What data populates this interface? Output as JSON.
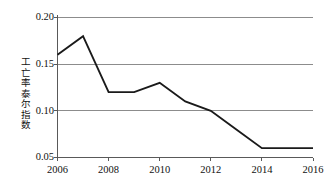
{
  "chart_data": {
    "type": "line",
    "title": "",
    "subtitle": "",
    "xlabel": "（年份）",
    "ylabel": "工亡率泰尔指数",
    "x": [
      2006,
      2007,
      2008,
      2009,
      2010,
      2011,
      2012,
      2013,
      2014,
      2015,
      2016
    ],
    "values": [
      0.16,
      0.18,
      0.12,
      0.12,
      0.13,
      0.11,
      0.1,
      0.08,
      0.06,
      0.06,
      0.06
    ],
    "series": [
      {
        "name": "工亡率泰尔指数",
        "values": [
          0.16,
          0.18,
          0.12,
          0.12,
          0.13,
          0.11,
          0.1,
          0.08,
          0.06,
          0.06,
          0.06
        ]
      }
    ],
    "xlim": [
      2006,
      2016
    ],
    "ylim": [
      0.05,
      0.2
    ],
    "xticks": [
      2006,
      2008,
      2010,
      2012,
      2014,
      2016
    ],
    "xtick_labels": [
      "2006",
      "2008",
      "2010",
      "2012",
      "2014",
      "2016"
    ],
    "yticks": [
      0.05,
      0.1,
      0.15,
      0.2
    ],
    "ytick_labels": [
      "0.05",
      "0.10",
      "0.15",
      "0.20"
    ],
    "grid": "horizontal",
    "legend": "none",
    "line_color": "#1a1a1a",
    "grid_color": "#8c8c8c",
    "axis_color": "#595959",
    "background_color": "#ffffff",
    "annotations": []
  },
  "axis": {
    "y_title": "工亡率泰尔指数",
    "x_unit_label": "（年份）"
  }
}
